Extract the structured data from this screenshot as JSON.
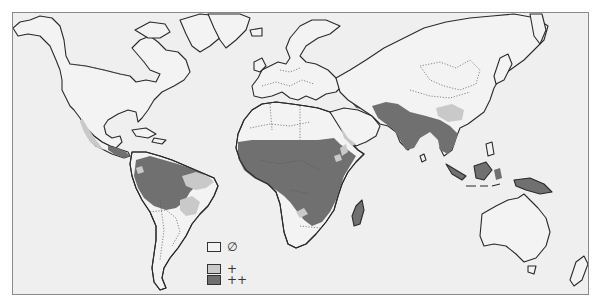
{
  "map": {
    "type": "world choropleth (prevalence zones)",
    "colors": {
      "background": "#efefef",
      "land": "#f3f3f3",
      "none": "#f3f3f3",
      "low": "#c9c9c9",
      "high": "#707070",
      "outline": "#2a2a2a",
      "frame": "#8a8a8a"
    },
    "regions": {
      "high": [
        "Central America",
        "Amazon basin",
        "Sub-Saharan Africa",
        "Madagascar",
        "South Asia",
        "Southeast Asia",
        "Indonesia",
        "New Guinea"
      ],
      "low": [
        "Mexico west coast",
        "Brazil east",
        "Horn of Africa patches",
        "Southern Africa patches",
        "Arabian Peninsula coast",
        "Southern China"
      ],
      "none": [
        "North America",
        "Europe",
        "Russia",
        "Australia",
        "Southern South America",
        "Southern Africa",
        "North Africa"
      ]
    }
  },
  "legend": {
    "items": [
      {
        "symbol": "∅",
        "level": "none",
        "color": "#f3f3f3"
      },
      {
        "symbol": "+",
        "level": "low",
        "color": "#c9c9c9"
      },
      {
        "symbol": "++",
        "level": "high",
        "color": "#707070"
      }
    ]
  }
}
